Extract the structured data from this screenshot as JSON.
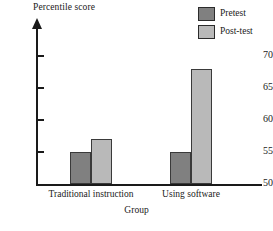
{
  "chart_data": {
    "type": "bar",
    "title": "",
    "subtitle": "",
    "xlabel": "Group",
    "ylabel": "Percentile score",
    "categories": [
      "Traditional instruction",
      "Using software"
    ],
    "series": [
      {
        "name": "Pretest",
        "values": [
          55,
          55
        ],
        "color": "#808080"
      },
      {
        "name": "Post-test",
        "values": [
          57,
          68
        ],
        "color": "#b9b9b9"
      }
    ],
    "ylim": [
      50,
      72
    ],
    "yticks": [
      50,
      55,
      60,
      65,
      70
    ],
    "ytick_labels": [
      "50",
      "55",
      "60",
      "65",
      "70"
    ],
    "grid": false,
    "legend_position": "top-right",
    "axis_color": "#1a1a1a",
    "background_color": "#ffffff",
    "y_axis_has_arrow": true,
    "annotations": []
  },
  "legend": {
    "entries": [
      {
        "label": "Pretest",
        "color": "#808080"
      },
      {
        "label": "Post-test",
        "color": "#b9b9b9"
      }
    ]
  },
  "axes": {
    "y_title": "Percentile score",
    "x_title": "Group",
    "y_tick_labels": [
      "70",
      "65",
      "60",
      "55",
      "50"
    ],
    "x_tick_labels": [
      "Traditional instruction",
      "Using software"
    ]
  }
}
